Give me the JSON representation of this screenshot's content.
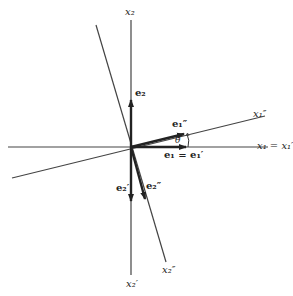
{
  "diagram": {
    "type": "coordinate-rotation",
    "axes": {
      "x2_top": "x₂",
      "x2_prime_bottom": "x₂′",
      "x2_dprime_bottom": "x₂″",
      "x1_eq": "x₁ = x₁′",
      "x1_dprime": "x₁″"
    },
    "vectors": {
      "e2": "e₂",
      "e1_eq": "e₁ = e₁′",
      "e1_dprime": "e₁″",
      "e2_prime": "e₂′",
      "e2_dprime": "e₂″"
    },
    "angle_label": "θ"
  }
}
